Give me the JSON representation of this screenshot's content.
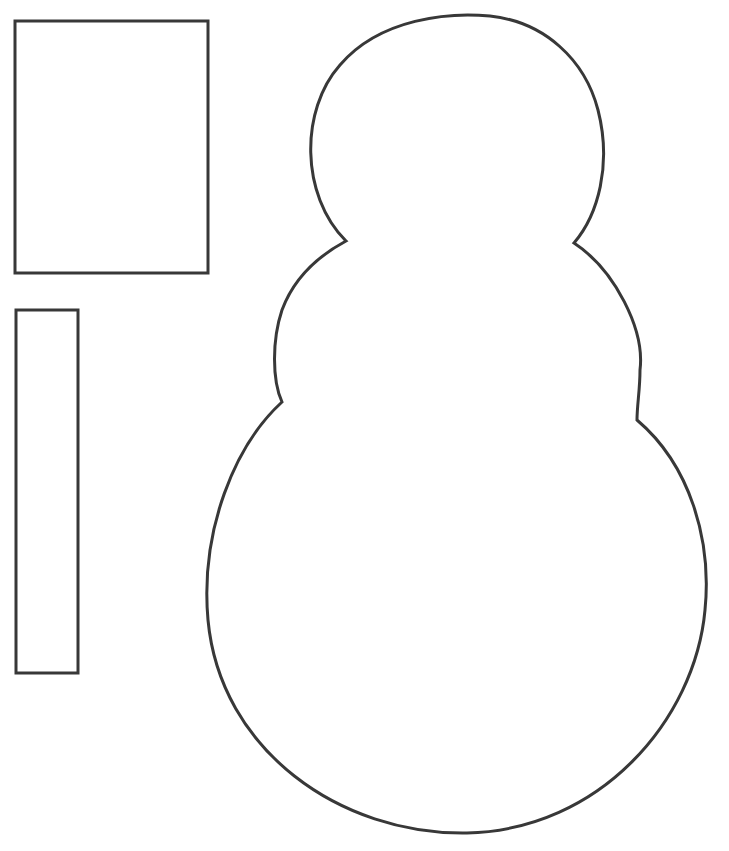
{
  "page": {
    "background": "#ffffff",
    "stroke_color": "#383838",
    "stroke_width": 3
  },
  "shapes": {
    "hat_rectangle": {
      "x": 15,
      "y": 21,
      "width": 193,
      "height": 252
    },
    "scarf_strip": {
      "x": 16,
      "y": 310,
      "width": 62,
      "height": 363
    },
    "snowman_outline": {
      "head": {
        "top": 15,
        "left": 313,
        "right": 603
      },
      "neck_notches": {
        "left": [
          346,
          241
        ],
        "right": [
          574,
          243
        ]
      },
      "waist_notches": {
        "left": [
          282,
          402
        ],
        "right": [
          637,
          420
        ]
      },
      "base": {
        "left": 207,
        "right": 706,
        "bottom": 833
      }
    }
  }
}
